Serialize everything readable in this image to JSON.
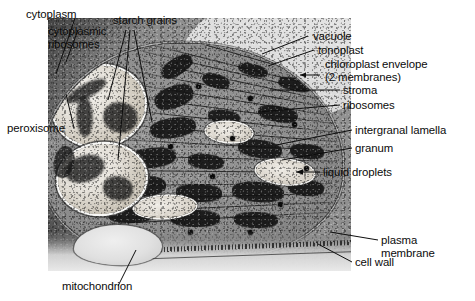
{
  "figure": {
    "type": "annotated-electron-micrograph",
    "labels": [
      {
        "id": "cytoplasm",
        "text": "cytoplasm"
      },
      {
        "id": "cytoplasmic-ribosomes",
        "text": "cytoplasmic\nribosomes"
      },
      {
        "id": "starch-grains",
        "text": "starch grains"
      },
      {
        "id": "peroxisome",
        "text": "peroxisome"
      },
      {
        "id": "vacuole",
        "text": "vacuole"
      },
      {
        "id": "tonoplast",
        "text": "tonoplast"
      },
      {
        "id": "chloroplast-envelope",
        "text": "chloroplast envelope\n(2 membranes)"
      },
      {
        "id": "stroma",
        "text": "stroma"
      },
      {
        "id": "ribosomes",
        "text": "ribosomes"
      },
      {
        "id": "intergranal-lamella",
        "text": "intergranal lamella"
      },
      {
        "id": "granum",
        "text": "granum"
      },
      {
        "id": "liquid-droplets",
        "text": "liquid droplets"
      },
      {
        "id": "plasma-membrane",
        "text": "plasma\nmembrane"
      },
      {
        "id": "cell-wall",
        "text": "cell wall"
      },
      {
        "id": "mitochondrion",
        "text": "mitochondrion"
      }
    ],
    "colors": {
      "page_background": "#ffffff",
      "label_text": "#0b0b0b",
      "leader_line": "#0d0d0d",
      "micrograph_mid_gray": "#8d8d8d",
      "micrograph_dark": "#141414",
      "micrograph_light": "#efece6"
    }
  }
}
